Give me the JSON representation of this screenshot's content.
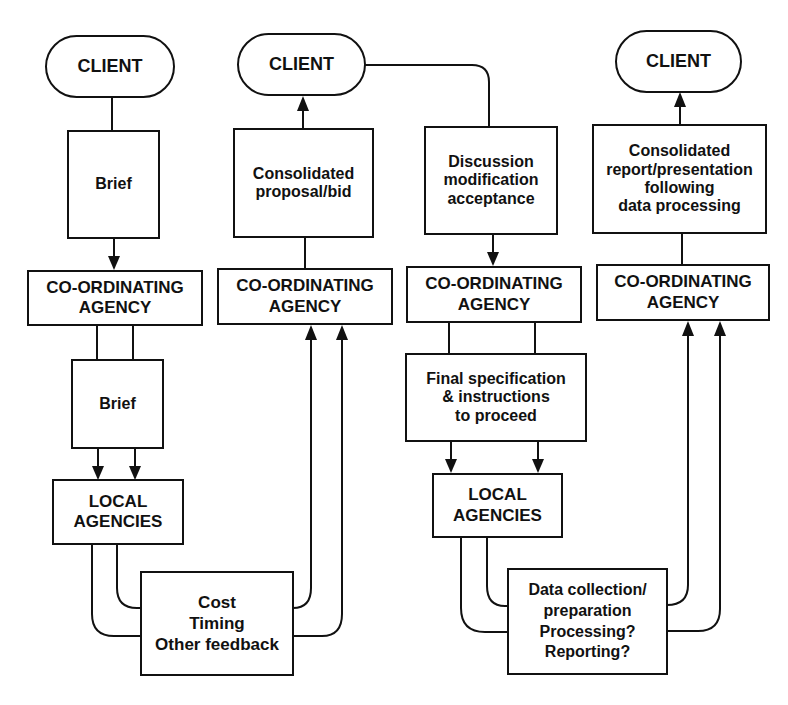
{
  "diagram": {
    "type": "flowchart",
    "columns": [
      {
        "id": "stage-1",
        "client": "CLIENT",
        "message_box": [
          "Brief"
        ],
        "coordinator": [
          "CO-ORDINATING",
          "AGENCY"
        ],
        "sub_message_box": [
          "Brief"
        ],
        "local": [
          "LOCAL",
          "AGENCIES"
        ],
        "flow": "Client → Brief → Co-ordinating agency → Brief → Local agencies"
      },
      {
        "id": "stage-2",
        "client": "CLIENT",
        "message_box": [
          "Consolidated",
          "proposal/bid"
        ],
        "coordinator": [
          "CO-ORDINATING",
          "AGENCY"
        ],
        "feedback_box": [
          "Cost",
          "Timing",
          "Other feedback"
        ],
        "flow": "Local agencies → Cost/Timing/Other feedback → Co-ordinating agency → Consolidated proposal/bid → Client"
      },
      {
        "id": "stage-3",
        "message_box": [
          "Discussion",
          "modification",
          "acceptance"
        ],
        "coordinator": [
          "CO-ORDINATING",
          "AGENCY"
        ],
        "sub_message_box": [
          "Final specification",
          "& instructions",
          "to proceed"
        ],
        "local": [
          "LOCAL",
          "AGENCIES"
        ],
        "flow": "Client → Discussion/modification/acceptance → Co-ordinating agency → Final specification & instructions to proceed → Local agencies"
      },
      {
        "id": "stage-4",
        "client": "CLIENT",
        "message_box": [
          "Consolidated",
          "report/presentation",
          "following",
          "data processing"
        ],
        "coordinator": [
          "CO-ORDINATING",
          "AGENCY"
        ],
        "feedback_box": [
          "Data collection/",
          "preparation",
          "Processing?",
          "Reporting?"
        ],
        "flow": "Local agencies → Data collection/preparation, Processing?, Reporting? → Co-ordinating agency → Consolidated report/presentation → Client"
      }
    ]
  }
}
